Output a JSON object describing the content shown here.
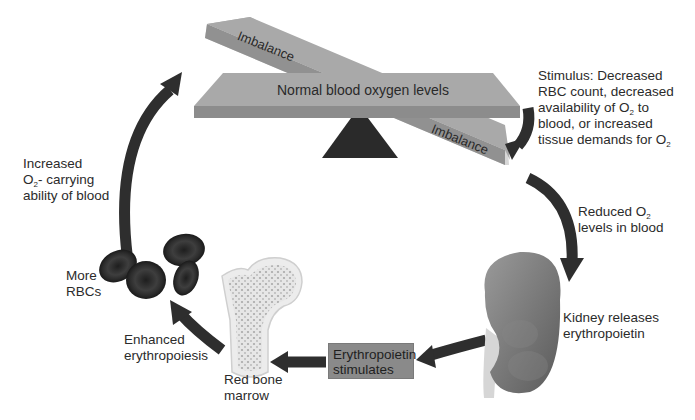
{
  "seesaw": {
    "level_label": "Normal blood oxygen levels",
    "imbalance_top": "Imbalance",
    "imbalance_bottom": "Imbalance"
  },
  "labels": {
    "stimulus": [
      "Stimulus: Decreased",
      "RBC count, decreased",
      "availability of O",
      "to",
      "blood, or  increased",
      "tissue demands for O"
    ],
    "reduced_o2": [
      "Reduced O",
      "levels in blood"
    ],
    "kidney": [
      "Kidney releases",
      "erythropoietin"
    ],
    "epo_box": [
      "Erythropoietin",
      "stimulates"
    ],
    "bone_marrow": [
      "Red bone",
      "marrow"
    ],
    "erythropoiesis": [
      "Enhanced",
      "erythropoiesis"
    ],
    "more_rbcs": [
      "More",
      "RBCs"
    ],
    "increased_o2": [
      "Increased",
      "O",
      "- carrying",
      "ability of blood"
    ],
    "subscript": "2"
  },
  "colors": {
    "beam": "#a8a8a8",
    "beam_edge": "#8e8e8e",
    "fulcrum": "#2a2a2a",
    "arrow": "#2e2e2e",
    "kidney": "#7a7a7a",
    "rbc": "#3a3a3a",
    "epo_box": "#8a8a8a"
  }
}
